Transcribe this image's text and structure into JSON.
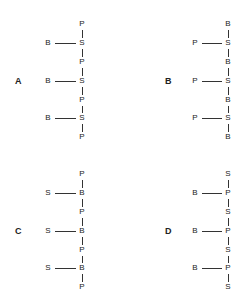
{
  "panels": [
    {
      "label": "A",
      "backbone": [
        "P",
        "S",
        "P",
        "S",
        "P",
        "S",
        "P"
      ],
      "side": "B",
      "branch_on": "S"
    },
    {
      "label": "B",
      "backbone": [
        "B",
        "S",
        "B",
        "S",
        "B",
        "S",
        "B"
      ],
      "side": "P",
      "branch_on": "S"
    },
    {
      "label": "C",
      "backbone": [
        "P",
        "B",
        "P",
        "B",
        "P",
        "B",
        "P"
      ],
      "side": "S",
      "branch_on": "B"
    },
    {
      "label": "D",
      "backbone": [
        "S",
        "P",
        "S",
        "P",
        "S",
        "P",
        "S"
      ],
      "side": "B",
      "branch_on": "P"
    }
  ]
}
